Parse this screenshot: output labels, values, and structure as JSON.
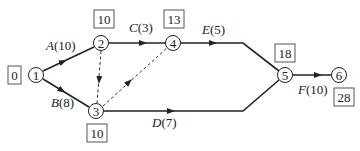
{
  "diagram": {
    "nodes": [
      {
        "id": "1",
        "label": "1",
        "time": "0"
      },
      {
        "id": "2",
        "label": "2",
        "time": "10"
      },
      {
        "id": "3",
        "label": "3",
        "time": "10"
      },
      {
        "id": "4",
        "label": "4",
        "time": "13"
      },
      {
        "id": "5",
        "label": "5",
        "time": "18"
      },
      {
        "id": "6",
        "label": "6",
        "time": "28"
      }
    ],
    "activities": [
      {
        "name": "A",
        "duration": "(10)",
        "from": "1",
        "to": "2"
      },
      {
        "name": "B",
        "duration": "(8)",
        "from": "1",
        "to": "3"
      },
      {
        "name": "C",
        "duration": "(3)",
        "from": "2",
        "to": "4"
      },
      {
        "name": "D",
        "duration": "(7)",
        "from": "3",
        "to": "5"
      },
      {
        "name": "E",
        "duration": "(5)",
        "from": "4",
        "to": "5"
      },
      {
        "name": "F",
        "duration": "(10)",
        "from": "5",
        "to": "6"
      }
    ],
    "dummies": [
      {
        "from": "2",
        "to": "3"
      },
      {
        "from": "3",
        "to": "4"
      }
    ]
  }
}
